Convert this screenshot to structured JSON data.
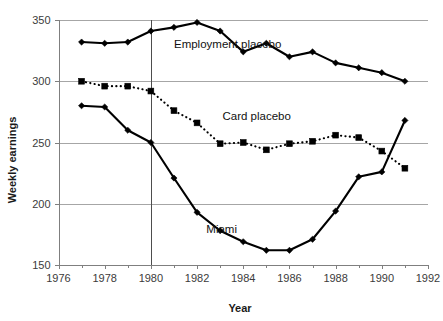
{
  "chart_data": {
    "type": "line",
    "title": "",
    "xlabel": "Year",
    "ylabel": "Weekly earnings",
    "xlim": [
      1976,
      1992
    ],
    "ylim": [
      150,
      350
    ],
    "xticks": [
      1976,
      1978,
      1980,
      1982,
      1984,
      1986,
      1988,
      1990,
      1992
    ],
    "xtick_labels": [
      "1976",
      "1978",
      "1980",
      "1982",
      "1984",
      "1986",
      "1988",
      "1990",
      "1992"
    ],
    "xminor_ticks": [
      1977,
      1979,
      1981,
      1983,
      1985,
      1987,
      1989,
      1991
    ],
    "yticks": [
      150,
      200,
      250,
      300,
      350
    ],
    "ytick_labels": [
      "150",
      "200",
      "250",
      "300",
      "350"
    ],
    "grid": "horizontal",
    "legend": "inline-annotations",
    "annotations": [
      {
        "text": "Employment placebo",
        "x": 1981.0,
        "y": 327.0
      },
      {
        "text": "Card placebo",
        "x": 1983.1,
        "y": 268.0
      },
      {
        "text": "Miami",
        "x": 1982.4,
        "y": 176.0
      }
    ],
    "reference_lines": [
      {
        "orientation": "vertical",
        "x": 1980,
        "label": ""
      }
    ],
    "x": [
      1977,
      1978,
      1979,
      1980,
      1981,
      1982,
      1983,
      1984,
      1985,
      1986,
      1987,
      1988,
      1989,
      1990,
      1991
    ],
    "series": [
      {
        "name": "Employment placebo",
        "style": "solid",
        "marker": "diamond",
        "values": [
          332,
          331,
          332,
          341,
          344,
          348,
          341,
          324,
          331,
          320,
          324,
          315,
          311,
          307,
          300
        ]
      },
      {
        "name": "Card placebo",
        "style": "dotted",
        "marker": "square",
        "values": [
          300,
          296,
          296,
          292,
          276,
          266,
          249,
          250,
          244,
          249,
          251,
          256,
          254,
          243,
          229
        ]
      },
      {
        "name": "Miami",
        "style": "solid",
        "marker": "diamond",
        "values": [
          280,
          279,
          260,
          250,
          221,
          193,
          178,
          169,
          162,
          162,
          171,
          194,
          222,
          226,
          268
        ]
      }
    ]
  },
  "axes": {
    "y_title": "Weekly earnings",
    "x_title": "Year"
  }
}
